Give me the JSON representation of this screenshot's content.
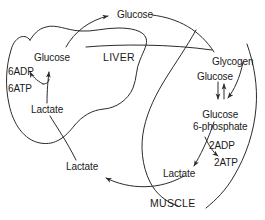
{
  "diagram": {
    "type": "biochemical-pathway",
    "background_color": "#ffffff",
    "stroke_color": "#2b2b2b",
    "text_color": "#1a1a1a",
    "compartments": [
      {
        "id": "liver",
        "label": "LIVER"
      },
      {
        "id": "muscle",
        "label": "MUSCLE"
      }
    ],
    "labels": {
      "blood_glucose": "Glucose",
      "liver_glucose": "Glucose",
      "liver_6adp": "6ADP",
      "liver_6atp": "6ATP",
      "liver_lactate": "Lactate",
      "blood_lactate": "Lactate",
      "muscle_glycogen": "Glycogen",
      "muscle_glucose": "Glucose",
      "muscle_g6p_line1": "Glucose",
      "muscle_g6p_line2": "6-phosphate",
      "muscle_2adp": "2ADP",
      "muscle_2atp": "2ATP",
      "muscle_lactate": "Lactate"
    }
  }
}
